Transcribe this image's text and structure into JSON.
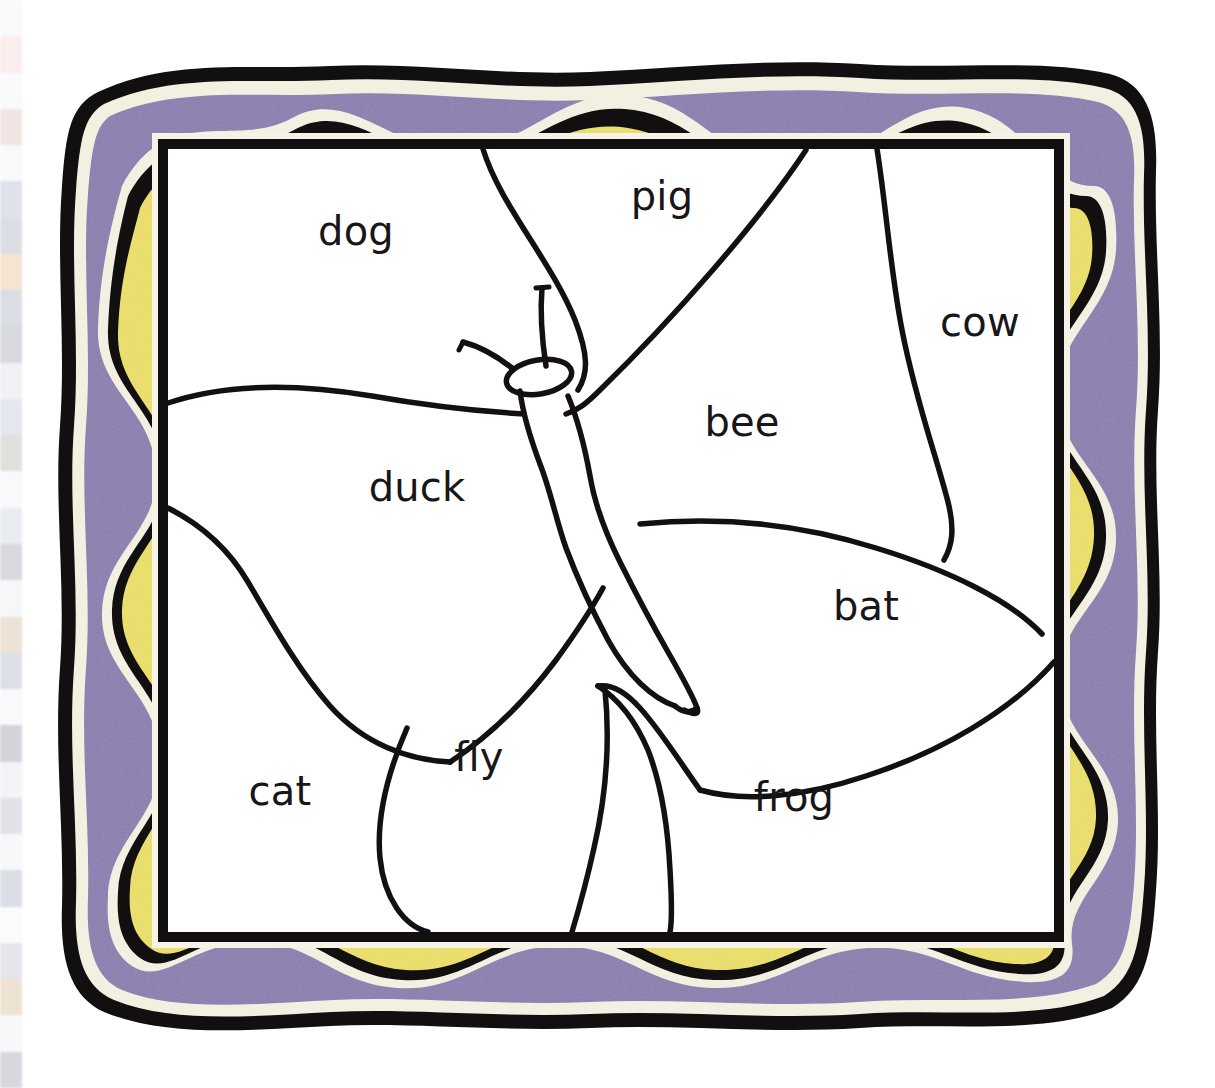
{
  "page": {
    "background_color": "#ffffff",
    "width": 1215,
    "height": 1088
  },
  "bleed_strip": {
    "name": "adjacent-page-bleed",
    "description": "Faint blurred sliver of a neighbouring page at the far left edge",
    "swatches": [
      "#e9eef5",
      "#f2c9c9",
      "#eceff4",
      "#d9a9a9",
      "#e7ecf2",
      "#9aa0b8",
      "#8e94ad",
      "#e3a46a",
      "#8a90aa",
      "#7e8498",
      "#cfd6e0",
      "#a9b2c4",
      "#96a08f",
      "#e8ecf1",
      "#b9c2d0",
      "#7d8498",
      "#dfe5ee",
      "#c1a07a",
      "#8f97ab",
      "#eaeef4",
      "#6e7488",
      "#d6dce6",
      "#9ba3b6",
      "#e4e9f0",
      "#8b93a8",
      "#f0f3f7",
      "#a8b0c2",
      "#caa06f",
      "#e6eaf1",
      "#7a8194"
    ]
  },
  "frame": {
    "name": "decorative-wavy-frame",
    "layers": [
      {
        "name": "outer-black-outline",
        "color": "#120f10"
      },
      {
        "name": "outer-cream-gap",
        "color": "#f3f0e2"
      },
      {
        "name": "purple-band",
        "color": "#8a7cb0"
      },
      {
        "name": "mid-cream-gap",
        "color": "#f3f0e2"
      },
      {
        "name": "mid-black-wave",
        "color": "#120f10"
      },
      {
        "name": "yellow-band",
        "color": "#ede163"
      },
      {
        "name": "inner-cream-gap",
        "color": "#f6f3e6"
      },
      {
        "name": "inner-black-rect",
        "color": "#120f10"
      }
    ],
    "canvas_color": "#ffffff"
  },
  "drawing": {
    "name": "butterfly-line-drawing",
    "stroke_color": "#141011",
    "parts": [
      "head-ellipse",
      "left-antenna",
      "right-antenna",
      "body",
      "upper-left-wing",
      "upper-right-wing",
      "lower-left-wing",
      "lower-right-wing"
    ]
  },
  "labels": [
    {
      "id": "dog",
      "text": "dog",
      "x": 356,
      "y": 231
    },
    {
      "id": "pig",
      "text": "pig",
      "x": 662,
      "y": 196
    },
    {
      "id": "cow",
      "text": "cow",
      "x": 980,
      "y": 322
    },
    {
      "id": "bee",
      "text": "bee",
      "x": 742,
      "y": 422
    },
    {
      "id": "duck",
      "text": "duck",
      "x": 417,
      "y": 487
    },
    {
      "id": "bat",
      "text": "bat",
      "x": 866,
      "y": 606
    },
    {
      "id": "fly",
      "text": "fly",
      "x": 479,
      "y": 757
    },
    {
      "id": "cat",
      "text": "cat",
      "x": 280,
      "y": 791
    },
    {
      "id": "frog",
      "text": "frog",
      "x": 794,
      "y": 797
    }
  ]
}
